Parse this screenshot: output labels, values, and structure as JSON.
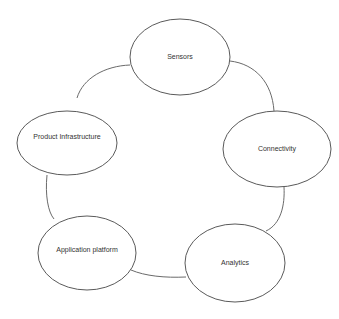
{
  "diagram": {
    "type": "cycle",
    "colors": {
      "stroke": "#5a5a5a",
      "connector": "#6a6a6a",
      "text": "#333333",
      "background": "#ffffff"
    },
    "nodes": [
      {
        "id": "sensors",
        "label": "Sensors",
        "cx": 180,
        "cy": 57,
        "rx": 50,
        "ry": 38
      },
      {
        "id": "connectivity",
        "label": "Connectivity",
        "cx": 277,
        "cy": 149,
        "rx": 54,
        "ry": 38
      },
      {
        "id": "analytics",
        "label": "Analytics",
        "cx": 235,
        "cy": 263,
        "rx": 50,
        "ry": 39
      },
      {
        "id": "application-platform",
        "label": "Application platform",
        "cx": 87,
        "cy": 253,
        "rx": 49,
        "ry": 37
      },
      {
        "id": "product-infrastructure",
        "label": "Product Infrastructure",
        "cx": 67,
        "cy": 143,
        "rx": 50,
        "ry": 32
      }
    ],
    "edges": [
      {
        "from": "sensors",
        "to": "connectivity"
      },
      {
        "from": "connectivity",
        "to": "analytics"
      },
      {
        "from": "analytics",
        "to": "application-platform"
      },
      {
        "from": "application-platform",
        "to": "product-infrastructure"
      },
      {
        "from": "product-infrastructure",
        "to": "sensors"
      }
    ]
  }
}
